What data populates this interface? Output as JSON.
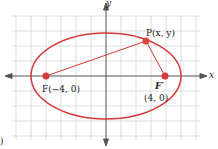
{
  "diagram": {
    "type": "ellipse-with-foci",
    "axes": {
      "x_label": "x",
      "y_label": "y"
    },
    "point_p": {
      "label": "P(x, y)"
    },
    "focus_left": {
      "label": "F(−4, 0)"
    },
    "focus_right": {
      "label": "F′",
      "coords": "(4, 0)"
    },
    "corner_mark": ")",
    "colors": {
      "curve": "#d33a3a",
      "grid": "#d0d0d0",
      "axis": "#555555"
    }
  }
}
